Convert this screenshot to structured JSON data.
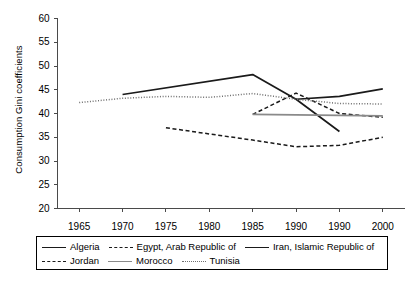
{
  "chart_data": {
    "type": "line",
    "title": "",
    "xlabel": "",
    "ylabel": "Consumption Gini coefficients",
    "ylim": [
      20,
      60
    ],
    "yticks": [
      20,
      25,
      30,
      35,
      40,
      45,
      50,
      55,
      60
    ],
    "xticks": [
      "1965",
      "1970",
      "1975",
      "1980",
      "1985",
      "1990",
      "1990",
      "2000"
    ],
    "grid": false,
    "legend_position": "bottom",
    "series": [
      {
        "name": "Algeria",
        "style": "solid",
        "color": "#1a1a1a",
        "points": [
          {
            "x": "1970",
            "y": 44.0
          },
          {
            "x": "1985",
            "y": 48.2
          },
          {
            "x": "1990",
            "y": 43.0
          },
          {
            "x": "1990b",
            "y": 36.2
          }
        ]
      },
      {
        "name": "Egypt, Arab Republic of",
        "style": "dashed",
        "color": "#1a1a1a",
        "points": [
          {
            "x": "1985",
            "y": 39.8
          },
          {
            "x": "1990",
            "y": 44.3
          },
          {
            "x": "1990b",
            "y": 40.0
          },
          {
            "x": "2000",
            "y": 39.2
          }
        ]
      },
      {
        "name": "Iran, Islamic Republic of",
        "style": "solid",
        "color": "#1a1a1a",
        "points": [
          {
            "x": "1990",
            "y": 43.0
          },
          {
            "x": "1990b",
            "y": 43.6
          },
          {
            "x": "2000",
            "y": 45.2
          }
        ]
      },
      {
        "name": "Jordan",
        "style": "dashed",
        "color": "#1a1a1a",
        "points": [
          {
            "x": "1975",
            "y": 37.0
          },
          {
            "x": "1980",
            "y": 35.7
          },
          {
            "x": "1985",
            "y": 34.4
          },
          {
            "x": "1990",
            "y": 33.0
          },
          {
            "x": "1990b",
            "y": 33.3
          },
          {
            "x": "2000",
            "y": 35.0
          }
        ]
      },
      {
        "name": "Morocco",
        "style": "solid",
        "color": "#8a8a8a",
        "points": [
          {
            "x": "1985",
            "y": 39.8
          },
          {
            "x": "1990",
            "y": 39.7
          },
          {
            "x": "1990b",
            "y": 39.6
          },
          {
            "x": "2000",
            "y": 39.5
          }
        ]
      },
      {
        "name": "Tunisia",
        "style": "dotted",
        "color": "#6f6f6f",
        "points": [
          {
            "x": "1965",
            "y": 42.3
          },
          {
            "x": "1970",
            "y": 43.2
          },
          {
            "x": "1975",
            "y": 43.6
          },
          {
            "x": "1980",
            "y": 43.4
          },
          {
            "x": "1985",
            "y": 44.2
          },
          {
            "x": "1990",
            "y": 43.0
          },
          {
            "x": "1990b",
            "y": 42.1
          },
          {
            "x": "2000",
            "y": 42.0
          }
        ]
      }
    ]
  },
  "legend": {
    "row1": [
      {
        "label": "Algeria",
        "swatch": "solid"
      },
      {
        "label": "Egypt, Arab Republic of",
        "swatch": "dashed"
      },
      {
        "label": "Iran, Islamic Republic of",
        "swatch": "solid"
      }
    ],
    "row2": [
      {
        "label": "Jordan",
        "swatch": "dashed"
      },
      {
        "label": "Morocco",
        "swatch": "solid"
      },
      {
        "label": "Tunisia",
        "swatch": "dotted"
      }
    ]
  }
}
